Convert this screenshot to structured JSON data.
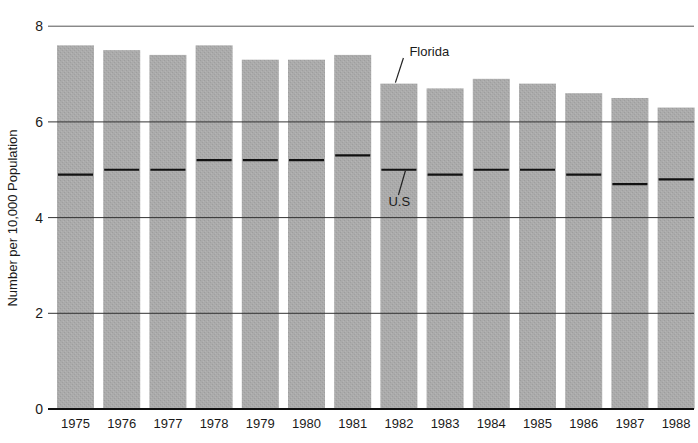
{
  "chart_data": {
    "type": "bar",
    "title": "",
    "xlabel": "",
    "ylabel": "Number per 10,000 Population",
    "ylim": [
      0,
      8
    ],
    "yticks": [
      0,
      2,
      4,
      6,
      8
    ],
    "grid": true,
    "legend_position": "annotations",
    "categories": [
      "1975",
      "1976",
      "1977",
      "1978",
      "1979",
      "1980",
      "1981",
      "1982",
      "1983",
      "1984",
      "1985",
      "1986",
      "1987",
      "1988"
    ],
    "series": [
      {
        "name": "Florida",
        "kind": "bar",
        "values": [
          7.6,
          7.5,
          7.4,
          7.6,
          7.3,
          7.3,
          7.4,
          6.8,
          6.7,
          6.9,
          6.8,
          6.6,
          6.5,
          6.3
        ]
      },
      {
        "name": "U.S",
        "kind": "level-marker",
        "values": [
          4.9,
          5.0,
          5.0,
          5.2,
          5.2,
          5.2,
          5.3,
          5.0,
          4.9,
          5.0,
          5.0,
          4.9,
          4.7,
          4.8
        ]
      }
    ],
    "annotations": [
      {
        "text": "Florida",
        "points_to": "1982 bar top"
      },
      {
        "text": "U.S",
        "points_to": "1982 U.S marker"
      }
    ],
    "colors": {
      "bar": "#aaaaaa",
      "marker": "#111111",
      "grid": "#333333"
    }
  }
}
